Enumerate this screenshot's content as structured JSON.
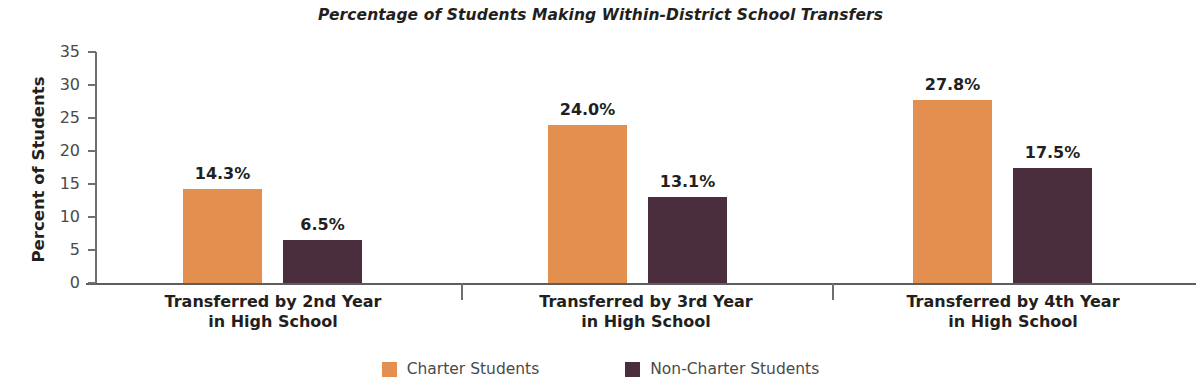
{
  "chart_data": {
    "type": "bar",
    "title": "Percentage of Students Making Within-District School Transfers",
    "xlabel": "",
    "ylabel": "Percent of Students",
    "ylim": [
      0,
      35
    ],
    "yticks": [
      0,
      5,
      10,
      15,
      20,
      25,
      30,
      35
    ],
    "ytick_labels": [
      "0",
      "5",
      "10",
      "15",
      "20",
      "25",
      "30",
      "35"
    ],
    "grid": false,
    "legend_position": "bottom-center",
    "categories": [
      "Transferred by 2nd Year in High School",
      "Transferred by 3rd Year in High School",
      "Transferred by 4th Year in High School"
    ],
    "category_lines": [
      [
        "Transferred by 2nd Year",
        "in High School"
      ],
      [
        "Transferred by 3rd Year",
        "in High School"
      ],
      [
        "Transferred by 4th Year",
        "in High School"
      ]
    ],
    "series": [
      {
        "name": "Charter Students",
        "color": "#E28F4F",
        "values": [
          14.3,
          24.0,
          27.8
        ],
        "labels": [
          "14.3%",
          "24.0%",
          "27.8%"
        ]
      },
      {
        "name": "Non-Charter Students",
        "color": "#4B2E3D",
        "values": [
          6.5,
          13.1,
          17.5
        ],
        "labels": [
          "6.5%",
          "13.1%",
          "17.5%"
        ]
      }
    ]
  },
  "legend": {
    "items": [
      {
        "label": "Charter Students",
        "color": "#E28F4F"
      },
      {
        "label": "Non-Charter Students",
        "color": "#4B2E3D"
      }
    ]
  },
  "axes": {
    "y_axis_color": "#6e6e6e",
    "x_axis_color": "#5d5d5d"
  }
}
